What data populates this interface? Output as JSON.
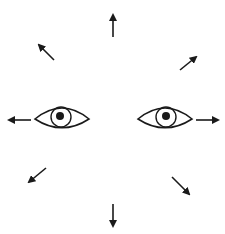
{
  "diagram": {
    "stroke_color": "#1a1a1a",
    "background": "#ffffff",
    "eyes": [
      {
        "name": "left-eye",
        "cx": 62,
        "cy": 119,
        "half_width": 27,
        "half_height": 11,
        "iris_cx": 61,
        "iris_cy": 117,
        "iris_r": 10,
        "pupil_cx": 60,
        "pupil_cy": 116,
        "pupil_r": 4
      },
      {
        "name": "right-eye",
        "cx": 165,
        "cy": 119,
        "half_width": 27,
        "half_height": 11,
        "iris_cx": 166,
        "iris_cy": 117,
        "iris_r": 10,
        "pupil_cx": 166,
        "pupil_cy": 116,
        "pupil_r": 4
      }
    ],
    "arrows": [
      {
        "direction": "up",
        "x1": 113,
        "y1": 37,
        "x2": 113,
        "y2": 15
      },
      {
        "direction": "up-left",
        "x1": 54,
        "y1": 60,
        "x2": 39,
        "y2": 45
      },
      {
        "direction": "up-right",
        "x1": 180,
        "y1": 70,
        "x2": 196,
        "y2": 57
      },
      {
        "direction": "left",
        "x1": 31,
        "y1": 120,
        "x2": 9,
        "y2": 120
      },
      {
        "direction": "right",
        "x1": 196,
        "y1": 120,
        "x2": 218,
        "y2": 120
      },
      {
        "direction": "down-left",
        "x1": 46,
        "y1": 168,
        "x2": 29,
        "y2": 182
      },
      {
        "direction": "down-right",
        "x1": 172,
        "y1": 177,
        "x2": 189,
        "y2": 194
      },
      {
        "direction": "down",
        "x1": 113,
        "y1": 204,
        "x2": 113,
        "y2": 226
      }
    ]
  }
}
